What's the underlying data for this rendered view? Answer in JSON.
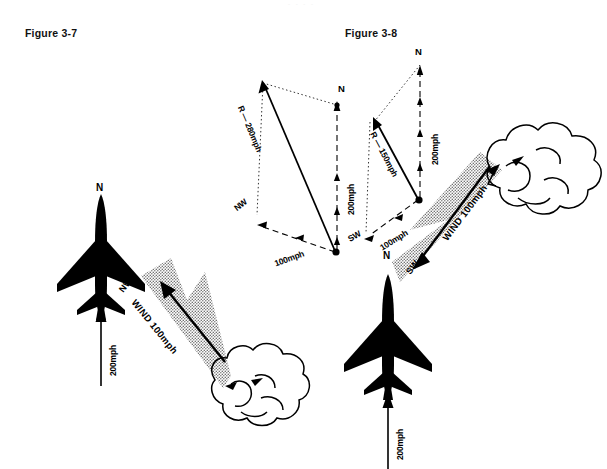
{
  "page": {
    "header_faint": "- - -  - ",
    "background_color": "#ffffff",
    "ink_color": "#000000",
    "stipple_color": "#8a8a8a"
  },
  "figures": [
    {
      "id": "figure-3-7",
      "caption": "Figure 3-7",
      "vector_diagram": {
        "north_label": "N",
        "aircraft_vector_label": "200mph",
        "wind_direction_label": "NW",
        "wind_vector_label": "100mph",
        "resultant_label": "R — 280mph"
      },
      "scene": {
        "compass_label": "N",
        "airspeed_label": "200mph",
        "wind_direction_label": "NW",
        "wind_label": "WIND 100mph"
      }
    },
    {
      "id": "figure-3-8",
      "caption": "Figure 3-8",
      "vector_diagram": {
        "north_label": "N",
        "aircraft_vector_label": "200mph",
        "wind_direction_label": "SW",
        "wind_vector_label": "100mph",
        "resultant_label": "R — 150mph"
      },
      "scene": {
        "compass_label": "N",
        "airspeed_label": "200mph",
        "wind_direction_label": "SW",
        "wind_label": "SW ← WIND 100mph",
        "wind_label_dir": "SW",
        "wind_label_main": "WIND 100mph"
      }
    }
  ]
}
